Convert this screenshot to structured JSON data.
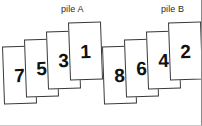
{
  "scene": {
    "width": 202,
    "height": 126,
    "background": "#ffffff",
    "border_color": "#8a8a8a",
    "card_fill": "#ffffff",
    "card_stroke": "#3a3a3a",
    "text_color": "#111111"
  },
  "piles": [
    {
      "key": "pile_a",
      "label": "pile A",
      "label_x": 61,
      "label_y": 4,
      "cards": [
        {
          "value": "7",
          "x": 3,
          "y": 46,
          "w": 33,
          "h": 58,
          "rot": -2.0,
          "z": 1
        },
        {
          "value": "5",
          "x": 25,
          "y": 39,
          "w": 33,
          "h": 58,
          "rot": -2.0,
          "z": 2
        },
        {
          "value": "3",
          "x": 47,
          "y": 31,
          "w": 33,
          "h": 58,
          "rot": -2.0,
          "z": 3
        },
        {
          "value": "1",
          "x": 69,
          "y": 22,
          "w": 33,
          "h": 58,
          "rot": -2.0,
          "z": 4
        }
      ]
    },
    {
      "key": "pile_b",
      "label": "pile B",
      "label_x": 161,
      "label_y": 4,
      "cards": [
        {
          "value": "8",
          "x": 103,
          "y": 46,
          "w": 33,
          "h": 58,
          "rot": -2.0,
          "z": 1
        },
        {
          "value": "6",
          "x": 125,
          "y": 39,
          "w": 33,
          "h": 58,
          "rot": -2.0,
          "z": 2
        },
        {
          "value": "4",
          "x": 147,
          "y": 31,
          "w": 33,
          "h": 58,
          "rot": -2.0,
          "z": 3
        },
        {
          "value": "2",
          "x": 169,
          "y": 22,
          "w": 33,
          "h": 58,
          "rot": -2.0,
          "z": 4
        }
      ]
    }
  ]
}
